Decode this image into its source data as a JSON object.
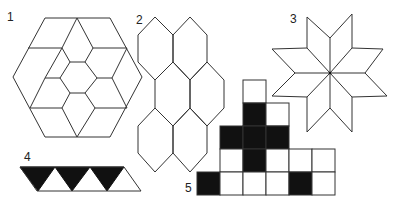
{
  "figures": [
    {
      "label": "1",
      "description": "hexagon tiled with rhombi around central hexagon"
    },
    {
      "label": "2",
      "description": "honeycomb of seven pointy-top hexagons"
    },
    {
      "label": "3",
      "description": "eight-pointed star of rhombi"
    },
    {
      "label": "4",
      "description": "strip of triangles, alternating black and white"
    },
    {
      "label": "5",
      "description": "stepped grid of squares, some filled black"
    }
  ],
  "grid": {
    "rows": [
      [
        null,
        null,
        "white",
        null,
        null,
        null
      ],
      [
        null,
        null,
        "black",
        "white",
        null,
        null
      ],
      [
        null,
        "black",
        "black",
        "black",
        null,
        null
      ],
      [
        null,
        "white",
        "black",
        "white",
        "white",
        "white"
      ],
      [
        "black",
        "white",
        "white",
        "white",
        "black",
        "white"
      ]
    ]
  },
  "colors": {
    "line": "#333333",
    "fill_dark": "#111111",
    "background": "#ffffff"
  }
}
